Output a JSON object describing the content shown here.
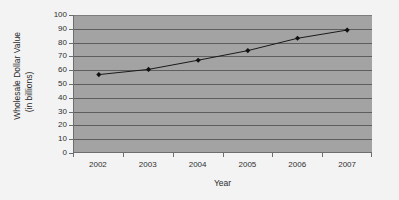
{
  "chart_data": {
    "type": "line",
    "title": "",
    "xlabel": "Year",
    "ylabel": "Wholesale Dollar Value (in billions)",
    "ylabel_line_1": "Wholesale Dollar Value",
    "ylabel_line_2": "(in billions)",
    "categories": [
      "2002",
      "2003",
      "2004",
      "2005",
      "2006",
      "2007"
    ],
    "x": [
      2002,
      2003,
      2004,
      2005,
      2006,
      2007
    ],
    "values": [
      56.5,
      60.3,
      67,
      74,
      83,
      89
    ],
    "series": [
      {
        "name": "Wholesale Dollar Value",
        "values": [
          56.5,
          60.3,
          67,
          74,
          83,
          89
        ]
      }
    ],
    "ylim": [
      0,
      100
    ],
    "ytick_labels": [
      "0",
      "10",
      "20",
      "30",
      "40",
      "50",
      "60",
      "70",
      "80",
      "90",
      "100"
    ],
    "ytick_values": [
      0,
      10,
      20,
      30,
      40,
      50,
      60,
      70,
      80,
      90,
      100
    ],
    "xtick_labels": [
      "2002",
      "2003",
      "2004",
      "2005",
      "2006",
      "2007"
    ],
    "grid": true,
    "grid_axis": "y",
    "legend": false,
    "legend_position": "none",
    "marker": "diamond",
    "colors": {
      "plot_background": "#a3a3a3",
      "page_background": "#f3f3f3",
      "gridline": "#5d5d5d",
      "axis": "#6d6d6d",
      "series_line": "#1a1a1a",
      "marker": "#111111",
      "text": "#2f2f2f"
    }
  }
}
